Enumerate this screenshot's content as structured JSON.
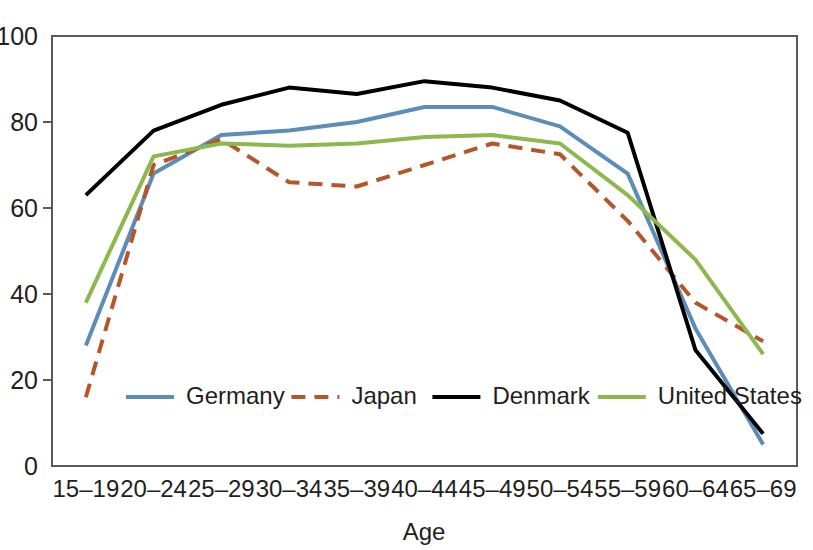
{
  "chart_data": {
    "type": "line",
    "title": "",
    "xlabel": "Age",
    "ylabel": "",
    "categories": [
      "15–19",
      "20–24",
      "25–29",
      "30–34",
      "35–39",
      "40–44",
      "45–49",
      "50–54",
      "55–59",
      "60–64",
      "65–69"
    ],
    "ylim": [
      0,
      100
    ],
    "yticks": [
      0,
      20,
      40,
      60,
      80,
      100
    ],
    "ytick_labels": [
      "0",
      "20",
      "40",
      "60",
      "80",
      "100"
    ],
    "grid": false,
    "legend_position": "inside-bottom-center",
    "series": [
      {
        "name": "Germany",
        "color": "#5b8db8",
        "style": "solid",
        "values": [
          28,
          68,
          77,
          78,
          80,
          83.5,
          83.5,
          79,
          68,
          32,
          5
        ]
      },
      {
        "name": "Japan",
        "color": "#b5562a",
        "style": "dashed",
        "values": [
          16,
          70,
          76,
          66,
          65,
          70,
          75,
          72.5,
          57,
          38,
          29
        ]
      },
      {
        "name": "Denmark",
        "color": "#000000",
        "style": "solid",
        "values": [
          63,
          78,
          84,
          88,
          86.5,
          89.5,
          88,
          85,
          77.5,
          27,
          7.5
        ]
      },
      {
        "name": "United States",
        "color": "#8cb84e",
        "style": "solid",
        "values": [
          38,
          72,
          75,
          74.5,
          75,
          76.5,
          77,
          75,
          63,
          48,
          26
        ]
      }
    ]
  },
  "axes": {
    "x_axis_title": "Age",
    "y_axis_title": ""
  },
  "legend": {
    "entries": [
      {
        "label": "Germany",
        "color": "#5b8db8",
        "style": "solid"
      },
      {
        "label": "Japan",
        "color": "#b5562a",
        "style": "dashed"
      },
      {
        "label": "Denmark",
        "color": "#000000",
        "style": "solid"
      },
      {
        "label": "United States",
        "color": "#8cb84e",
        "style": "solid"
      }
    ]
  }
}
